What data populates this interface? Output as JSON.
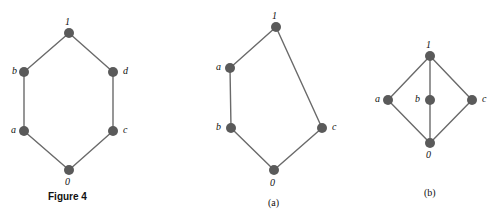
{
  "figure": {
    "caption": "Figure 4",
    "caption_x": 48,
    "caption_y": 192,
    "edge_color": "#6a6a6a",
    "node_color": "#5a5a5a",
    "node_radius": 5,
    "edge_width": 1.4
  },
  "diagrams": [
    {
      "id": "figure-4-hexagon-lattice",
      "name": "hexagonal-lattice",
      "sublabel": null,
      "nodes": [
        {
          "id": "top",
          "label": "1",
          "x": 69,
          "y": 33,
          "label_x": 65,
          "label_y": 17
        },
        {
          "id": "b",
          "label": "b",
          "x": 24,
          "y": 72,
          "label_x": 12,
          "label_y": 66
        },
        {
          "id": "d",
          "label": "d",
          "x": 113,
          "y": 72,
          "label_x": 123,
          "label_y": 66
        },
        {
          "id": "a",
          "label": "a",
          "x": 24,
          "y": 131,
          "label_x": 11,
          "label_y": 125
        },
        {
          "id": "c",
          "label": "c",
          "x": 113,
          "y": 131,
          "label_x": 123,
          "label_y": 125
        },
        {
          "id": "bottom",
          "label": "0",
          "x": 69,
          "y": 170,
          "label_x": 65,
          "label_y": 177
        }
      ],
      "edges": [
        {
          "from": "b",
          "to": "top"
        },
        {
          "from": "top",
          "to": "d"
        },
        {
          "from": "b",
          "to": "a"
        },
        {
          "from": "d",
          "to": "c"
        },
        {
          "from": "a",
          "to": "bottom"
        },
        {
          "from": "bottom",
          "to": "c"
        }
      ]
    },
    {
      "id": "diagram-a-lattice",
      "name": "pentagon-lattice-a",
      "sublabel": "(a)",
      "sublabel_x": 268,
      "sublabel_y": 198,
      "nodes": [
        {
          "id": "top",
          "label": "1",
          "x": 276,
          "y": 27,
          "label_x": 272,
          "label_y": 11
        },
        {
          "id": "a",
          "label": "a",
          "x": 230,
          "y": 68,
          "label_x": 216,
          "label_y": 62
        },
        {
          "id": "b",
          "label": "b",
          "x": 231,
          "y": 128,
          "label_x": 216,
          "label_y": 122
        },
        {
          "id": "c",
          "label": "c",
          "x": 322,
          "y": 128,
          "label_x": 332,
          "label_y": 122
        },
        {
          "id": "bottom",
          "label": "0",
          "x": 274,
          "y": 170,
          "label_x": 270,
          "label_y": 178
        }
      ],
      "edges": [
        {
          "from": "a",
          "to": "top"
        },
        {
          "from": "top",
          "to": "c"
        },
        {
          "from": "a",
          "to": "b"
        },
        {
          "from": "b",
          "to": "bottom"
        },
        {
          "from": "bottom",
          "to": "c"
        }
      ]
    },
    {
      "id": "diagram-b-lattice",
      "name": "diamond-lattice-b",
      "sublabel": "(b)",
      "sublabel_x": 424,
      "sublabel_y": 188,
      "nodes": [
        {
          "id": "top",
          "label": "1",
          "x": 430,
          "y": 56,
          "label_x": 426,
          "label_y": 40
        },
        {
          "id": "a",
          "label": "a",
          "x": 388,
          "y": 100,
          "label_x": 375,
          "label_y": 94
        },
        {
          "id": "b",
          "label": "b",
          "x": 430,
          "y": 100,
          "label_x": 415,
          "label_y": 94
        },
        {
          "id": "c",
          "label": "c",
          "x": 472,
          "y": 100,
          "label_x": 482,
          "label_y": 94
        },
        {
          "id": "bottom",
          "label": "0",
          "x": 430,
          "y": 143,
          "label_x": 426,
          "label_y": 150
        }
      ],
      "edges": [
        {
          "from": "a",
          "to": "top"
        },
        {
          "from": "b",
          "to": "top"
        },
        {
          "from": "c",
          "to": "top"
        },
        {
          "from": "a",
          "to": "bottom"
        },
        {
          "from": "b",
          "to": "bottom"
        },
        {
          "from": "c",
          "to": "bottom"
        }
      ]
    }
  ]
}
